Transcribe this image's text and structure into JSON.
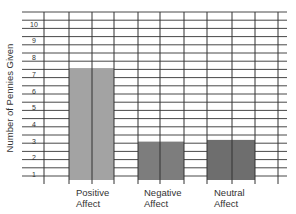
{
  "chart_data": {
    "type": "bar",
    "title": "",
    "xlabel": "",
    "ylabel": "Number of Pennies Given",
    "categories": [
      {
        "line1": "Positive",
        "line2": "Affect"
      },
      {
        "line1": "Negative",
        "line2": "Affect"
      },
      {
        "line1": "Neutral",
        "line2": "Affect"
      }
    ],
    "values": [
      7.2,
      2.8,
      2.9
    ],
    "yticks": [
      1,
      2,
      3,
      4,
      5,
      6,
      7,
      8,
      9,
      10
    ],
    "ylim": [
      0,
      11
    ],
    "grid": true,
    "colors": {
      "bars": [
        "#a3a3a3",
        "#7d7d7d",
        "#6e6e6e"
      ],
      "grid": "#333333"
    }
  }
}
